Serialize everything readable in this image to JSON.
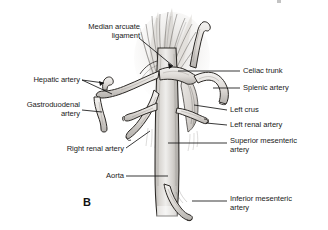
{
  "figure": {
    "panel_letter": "B"
  },
  "labels": {
    "median_arcuate_ligament": "Median arcuate\nligament",
    "hepatic_artery": "Hepatic artery",
    "gastroduodenal_artery": "Gastroduodenal\nartery",
    "right_renal_artery": "Right renal artery",
    "aorta": "Aorta",
    "celiac_trunk": "Celiac trunk",
    "splenic_artery": "Splenic artery",
    "left_crus": "Left crus",
    "left_renal_artery": "Left renal artery",
    "superior_mesenteric_artery": "Superior mesenteric\nartery",
    "inferior_mesenteric_artery": "Inferior mesenteric\nartery"
  },
  "colors": {
    "background": "#ffffff",
    "ink": "#1a1a1a",
    "vessel_fill": "#e9e7e5",
    "vessel_shade": "#b8b5b2",
    "muscle_fill": "#dedbd7",
    "leader_line": "#141414"
  }
}
